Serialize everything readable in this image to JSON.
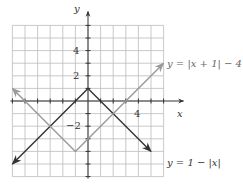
{
  "chart_data": {
    "type": "line",
    "title": "",
    "xlabel": "x",
    "ylabel": "y",
    "xlim": [
      -6,
      6
    ],
    "ylim": [
      -6,
      6
    ],
    "grid": true,
    "x_ticks_labeled": [
      4
    ],
    "y_ticks_labeled": [
      4,
      2,
      -2
    ],
    "series": [
      {
        "name": "y = 1 − |x|",
        "color": "#333333",
        "points": [
          [
            -6,
            -5
          ],
          [
            0,
            1
          ],
          [
            5,
            -4
          ]
        ]
      },
      {
        "name": "y = |x + 1| − 4",
        "color": "#999999",
        "points": [
          [
            -6,
            1
          ],
          [
            -1,
            -4
          ],
          [
            6,
            3
          ]
        ]
      }
    ],
    "legend": {
      "position": "inline-annotations",
      "entries": [
        "y = |x + 1| − 4",
        "y = 1 − |x|"
      ]
    }
  },
  "labels": {
    "y_axis": "y",
    "x_axis": "x",
    "tick_4_y": "4",
    "tick_2_y": "2",
    "tick_neg2_y": "−2",
    "tick_4_x": "4",
    "curve_gray": "y = |x + 1| − 4",
    "curve_dark": "y = 1 − |x|"
  }
}
